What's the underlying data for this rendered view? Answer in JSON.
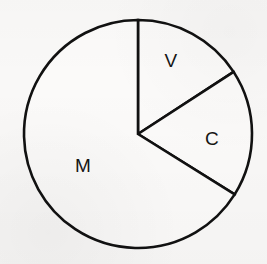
{
  "chart_data": {
    "type": "pie",
    "title": "",
    "subtitle": "",
    "xlabel": "",
    "ylabel": "",
    "grid": false,
    "legend_position": "none",
    "labels_inside_slices": true,
    "start_angle_deg_from_12oclock": 0,
    "direction": "clockwise",
    "categories": [
      "V",
      "C",
      "M"
    ],
    "values": [
      15.8,
      18.1,
      66.1
    ],
    "slices": [
      {
        "label": "V",
        "value": 15.8,
        "unit": "%",
        "sweep_deg": 57,
        "start_deg": 0,
        "end_deg": 57,
        "fill": "#fbfaf9",
        "stroke": "#111111",
        "label_x": 171,
        "label_y": 60
      },
      {
        "label": "C",
        "value": 18.1,
        "unit": "%",
        "sweep_deg": 65,
        "start_deg": 57,
        "end_deg": 122,
        "fill": "#fbfaf9",
        "stroke": "#111111",
        "label_x": 212,
        "label_y": 138
      },
      {
        "label": "M",
        "value": 66.1,
        "unit": "%",
        "sweep_deg": 238,
        "start_deg": 122,
        "end_deg": 360,
        "fill": "#fbfaf9",
        "stroke": "#111111",
        "label_x": 83,
        "label_y": 165
      }
    ],
    "geometry": {
      "center_x": 138,
      "center_y": 134,
      "radius": 114,
      "stroke_width": 2.6
    },
    "colors": {
      "background": "#f9f8f7",
      "line": "#111111",
      "slice_fill": "#fbfaf9",
      "label_text": "#151515"
    }
  }
}
